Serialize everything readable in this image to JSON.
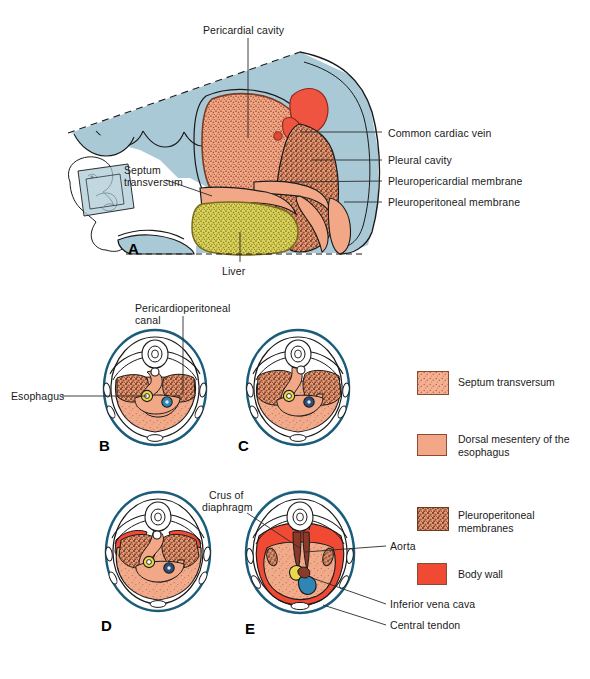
{
  "figure": {
    "width": 590,
    "height": 679
  },
  "panel_a": {
    "letter": "A",
    "labels": {
      "pericardial_cavity": "Pericardial cavity",
      "septum_transversum_l1": "Septum",
      "septum_transversum_l2": "transversum",
      "liver": "Liver",
      "common_cardiac_vein": "Common cardiac vein",
      "pleural_cavity": "Pleural cavity",
      "pleuropericardial_membrane": "Pleuropericardial membrane",
      "pleuroperitoneal_membrane": "Pleuroperitoneal membrane"
    },
    "inset": "embryo-orientation-inset"
  },
  "panel_b": {
    "letter": "B",
    "labels": {
      "pericardioperitoneal_canal_l1": "Pericardioperitoneal",
      "pericardioperitoneal_canal_l2": "canal",
      "esophagus": "Esophagus"
    }
  },
  "panel_c": {
    "letter": "C"
  },
  "panel_d": {
    "letter": "D"
  },
  "panel_e": {
    "letter": "E",
    "labels": {
      "crus_of_diaphragm_l1": "Crus of",
      "crus_of_diaphragm_l2": "diaphragm",
      "aorta": "Aorta",
      "inferior_vena_cava": "Inferior vena cava",
      "central_tendon": "Central tendon"
    }
  },
  "legend": {
    "items": [
      {
        "label": "Septum transversum",
        "swatch": "septum-transversum-swatch",
        "color": "#f0a987",
        "pattern": "fine-stipple"
      },
      {
        "label": "Dorsal mesentery of the\nesophagus",
        "swatch": "dorsal-mesentery-swatch",
        "color": "#f2a886",
        "pattern": "solid"
      },
      {
        "label": "Pleuroperitoneal\nmembranes",
        "swatch": "pleuroperitoneal-membranes-swatch",
        "color": "#c98b6b",
        "pattern": "coarse-stipple"
      },
      {
        "label": "Body wall",
        "swatch": "body-wall-swatch",
        "color": "#f04a35",
        "pattern": "solid"
      }
    ]
  },
  "colors": {
    "amnion_blue": "#a9c9d6",
    "septum_transversum": "#f0a987",
    "liver_yellow": "#d4cc53",
    "body_wall_red": "#f04a35",
    "cardiac_vein_red": "#ef5441",
    "pleuroperitoneal_brown": "#c98b6b",
    "outline": "#1a1a1a",
    "leader_line": "#2b2b2b",
    "vertebra_outline": "#2b2b2b",
    "aorta_dark": "#8b3a2a",
    "ivc_blue": "#2f86b5",
    "esophagus_yellow": "#e8d84a"
  }
}
